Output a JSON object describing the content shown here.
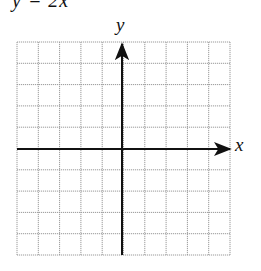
{
  "header": {
    "equation_fragment": "y = 2x"
  },
  "figure": {
    "type": "coordinate-grid",
    "grid": {
      "columns": 10,
      "rows": 10,
      "line_color": "#9a9a9a",
      "axis_color": "#111111"
    },
    "axes": {
      "x_label": "x",
      "y_label": "y"
    }
  }
}
